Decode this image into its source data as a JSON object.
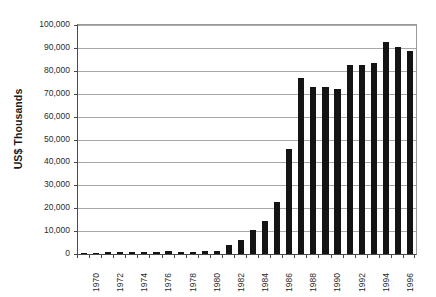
{
  "chart_data": {
    "type": "bar",
    "title": "",
    "subtitle": "",
    "xlabel": "",
    "ylabel": "US$ Thousands",
    "ylim": [
      0,
      100000
    ],
    "ytick_labels": [
      "100,000",
      "90,000",
      "80,000",
      "70,000",
      "60,000",
      "50,000",
      "40,000",
      "30,000",
      "20,000",
      "10,000",
      "0"
    ],
    "ytick_values": [
      100000,
      90000,
      80000,
      70000,
      60000,
      50000,
      40000,
      30000,
      20000,
      10000,
      0
    ],
    "ytick_interval": 10000,
    "grid": "horizontal",
    "legend": "none",
    "bar_color": "#141414",
    "gridline_color": "#a8a8a8",
    "axis_color": "#4a4a4a",
    "xtick_label_interval": 2,
    "xtick_labels_shown": [
      "1970",
      "1972",
      "1974",
      "1976",
      "1978",
      "1980",
      "1982",
      "1984",
      "1986",
      "1988",
      "1990",
      "1992",
      "1994",
      "1996"
    ],
    "categories": [
      "1970",
      "1971",
      "1972",
      "1973",
      "1974",
      "1975",
      "1976",
      "1977",
      "1978",
      "1979",
      "1980",
      "1981",
      "1982",
      "1983",
      "1984",
      "1985",
      "1986",
      "1987",
      "1988",
      "1989",
      "1990",
      "1991",
      "1992",
      "1993",
      "1994",
      "1995",
      "1996",
      "1997"
    ],
    "values": [
      400,
      500,
      700,
      800,
      800,
      800,
      900,
      1100,
      1000,
      1000,
      1100,
      1500,
      3800,
      6200,
      10400,
      14300,
      22700,
      46000,
      77000,
      73000,
      73000,
      72000,
      82500,
      82500,
      83500,
      92500,
      90500,
      88500
    ]
  }
}
